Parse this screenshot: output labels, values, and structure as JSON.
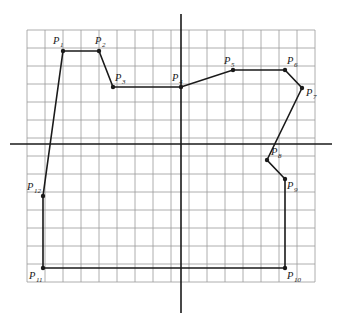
{
  "figure": {
    "background_color": "#ffffff",
    "grid": {
      "color": "#9a9a9a",
      "cell_size": 18,
      "x_start": 27,
      "y_start": 30,
      "cols": 16,
      "rows": 14,
      "visible": true
    },
    "axes": {
      "color": "#1a1a1a",
      "origin_px": {
        "x": 181,
        "y": 144
      },
      "x_axis": {
        "x1": 10,
        "y1": 144,
        "x2": 332,
        "y2": 144
      },
      "y_axis": {
        "x1": 181,
        "y1": 14,
        "x2": 181,
        "y2": 313
      }
    },
    "polyline": {
      "stroke_color": "#1a1a1a",
      "stroke_width": 1.6,
      "marker_color": "#1a1a1a",
      "marker_radius": 2.2,
      "closed": true
    }
  },
  "chart_data": {
    "type": "scatter",
    "xlabel": "",
    "ylabel": "",
    "grid": true,
    "legend": "none",
    "axis_units_per_cell": 1,
    "origin_cell": {
      "col": 8.56,
      "row": 6.33
    },
    "points": [
      {
        "label": "P",
        "index": "1",
        "px": 63,
        "py": 51,
        "x": -6,
        "y": 5.17,
        "label_dx": -10,
        "label_dy": -7
      },
      {
        "label": "P",
        "index": "2",
        "px": 99,
        "py": 51,
        "x": -4,
        "y": 5.17,
        "label_dx": -4,
        "label_dy": -7
      },
      {
        "label": "P",
        "index": "3",
        "px": 113,
        "py": 87,
        "x": -3.2,
        "y": 3.17,
        "label_dx": 2,
        "label_dy": -6
      },
      {
        "label": "P",
        "index": "4",
        "px": 181,
        "py": 87,
        "x": 0,
        "y": 3.17,
        "label_dx": -9,
        "label_dy": -6
      },
      {
        "label": "P",
        "index": "5",
        "px": 233,
        "py": 70,
        "x": 2.9,
        "y": 4.1,
        "label_dx": -9,
        "label_dy": -6
      },
      {
        "label": "P",
        "index": "6",
        "px": 285,
        "py": 70,
        "x": 5.8,
        "y": 4.1,
        "label_dx": 2,
        "label_dy": -6
      },
      {
        "label": "P",
        "index": "7",
        "px": 302,
        "py": 88,
        "x": 6.7,
        "y": 3.1,
        "label_dx": 4,
        "label_dy": 8
      },
      {
        "label": "P",
        "index": "8",
        "px": 267,
        "py": 160,
        "x": 4.8,
        "y": -0.9,
        "label_dx": 4,
        "label_dy": -5
      },
      {
        "label": "P",
        "index": "9",
        "px": 285,
        "py": 179,
        "x": 5.8,
        "y": -1.9,
        "label_dx": 2,
        "label_dy": 10
      },
      {
        "label": "P",
        "index": "10",
        "px": 285,
        "py": 268,
        "x": 5.8,
        "y": -6.9,
        "label_dx": 2,
        "label_dy": 11
      },
      {
        "label": "P",
        "index": "11",
        "px": 43,
        "py": 268,
        "x": -7.7,
        "y": -6.9,
        "label_dx": -14,
        "label_dy": 11
      },
      {
        "label": "P",
        "index": "12",
        "px": 43,
        "py": 196,
        "x": -7.7,
        "y": -2.9,
        "label_dx": -16,
        "label_dy": -6
      }
    ]
  }
}
